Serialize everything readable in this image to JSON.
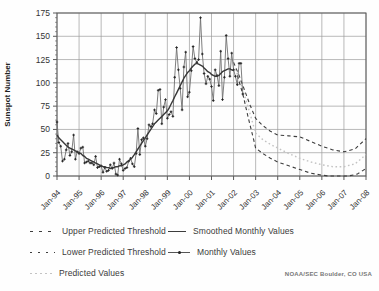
{
  "chart_data": {
    "type": "line",
    "title": "",
    "ylabel": "Sunspot Number",
    "ylim": [
      0,
      175
    ],
    "yticks": [
      0,
      25,
      50,
      75,
      100,
      125,
      150,
      175
    ],
    "y_minor_tick_step": 5,
    "xlim_years": [
      1994,
      2008
    ],
    "xtick_labels": [
      "Jan-94",
      "Jan-95",
      "Jan-96",
      "Jan-97",
      "Jan-98",
      "Jan-99",
      "Jan-00",
      "Jan-01",
      "Jan-02",
      "Jan-03",
      "Jan-04",
      "Jan-05",
      "Jan-06",
      "Jan-07",
      "Jan-08"
    ],
    "grid": true,
    "colors": {
      "grid": "#9b9b9b",
      "axis": "#5a5a5a",
      "monthly_line": "#6f6f6f",
      "monthly_marker": "#222222",
      "smoothed": "#383838",
      "threshold": "#3d3d3d",
      "predicted": "#c3c3c3",
      "tick_text": "#333333"
    },
    "series": [
      {
        "name": "Monthly Values",
        "type": "line+markers",
        "color": "#6f6f6f",
        "x_start": 1994.0,
        "x_step_months": 1,
        "values": [
          58,
          36,
          32,
          16,
          18,
          28,
          35,
          22,
          26,
          44,
          18,
          26,
          24,
          30,
          31,
          14,
          15,
          16,
          14,
          14,
          12,
          21,
          9,
          10,
          11,
          4,
          9,
          5,
          6,
          12,
          8,
          14,
          2,
          1,
          18,
          13,
          6,
          8,
          9,
          16,
          19,
          13,
          10,
          24,
          51,
          23,
          39,
          41,
          32,
          40,
          55,
          53,
          56,
          71,
          67,
          92,
          93,
          56,
          74,
          82,
          62,
          66,
          69,
          64,
          106,
          138,
          114,
          94,
          71,
          117,
          133,
          85,
          90,
          113,
          139,
          126,
          122,
          125,
          170,
          131,
          110,
          99,
          107,
          104,
          96,
          81,
          114,
          108,
          97,
          134,
          82,
          106,
          151,
          126,
          107,
          132,
          114,
          107,
          98,
          121,
          121,
          88
        ]
      },
      {
        "name": "Smoothed Monthly Values",
        "type": "line",
        "color": "#383838",
        "x_start": 1994.0,
        "x_step_months": 1,
        "values": [
          44,
          41,
          39,
          37,
          35,
          33,
          31,
          30,
          29,
          28,
          27,
          26,
          25,
          24,
          22,
          21,
          19,
          18,
          17,
          16,
          15,
          14,
          13,
          12,
          11,
          10,
          10,
          9,
          9,
          8,
          9,
          9,
          10,
          10,
          11,
          11,
          12,
          13,
          15,
          16,
          18,
          20,
          23,
          26,
          29,
          32,
          35,
          38,
          41,
          44,
          47,
          50,
          53,
          56,
          58,
          60,
          62,
          64,
          66,
          68,
          70,
          73,
          77,
          81,
          85,
          89,
          93,
          97,
          101,
          105,
          108,
          111,
          113,
          116,
          118,
          120,
          121,
          120,
          119,
          118,
          116,
          114,
          112,
          111,
          109,
          108,
          107,
          107,
          108,
          110,
          112,
          113,
          114,
          115,
          115,
          114,
          113
        ]
      },
      {
        "name": "Upper Predicted Threshold",
        "type": "dashed",
        "color": "#3d3d3d",
        "points": [
          [
            2002.0,
            122
          ],
          [
            2002.25,
            108
          ],
          [
            2002.5,
            92
          ],
          [
            2002.75,
            76
          ],
          [
            2003.0,
            62
          ],
          [
            2003.33,
            54
          ],
          [
            2003.67,
            48
          ],
          [
            2004.0,
            44
          ],
          [
            2004.5,
            43
          ],
          [
            2005.0,
            42
          ],
          [
            2005.5,
            37
          ],
          [
            2006.0,
            32
          ],
          [
            2006.5,
            28
          ],
          [
            2007.0,
            26
          ],
          [
            2007.5,
            29
          ],
          [
            2008.0,
            40
          ]
        ]
      },
      {
        "name": "Lower Predicted Threshold",
        "type": "dashed",
        "color": "#3d3d3d",
        "points": [
          [
            2002.17,
            108
          ],
          [
            2002.42,
            88
          ],
          [
            2002.67,
            62
          ],
          [
            2002.92,
            38
          ],
          [
            2003.0,
            30
          ],
          [
            2003.33,
            24
          ],
          [
            2003.67,
            19
          ],
          [
            2004.0,
            15
          ],
          [
            2004.5,
            11
          ],
          [
            2005.0,
            7
          ],
          [
            2005.5,
            3
          ],
          [
            2006.0,
            1
          ],
          [
            2006.3,
            0
          ],
          [
            2007.2,
            0
          ],
          [
            2007.6,
            2
          ],
          [
            2008.0,
            8
          ]
        ]
      },
      {
        "name": "Predicted Values",
        "type": "dotted",
        "color": "#c3c3c3",
        "points": [
          [
            2002.08,
            115
          ],
          [
            2002.33,
            99
          ],
          [
            2002.58,
            80
          ],
          [
            2002.83,
            60
          ],
          [
            2003.0,
            46
          ],
          [
            2003.33,
            39
          ],
          [
            2003.67,
            34
          ],
          [
            2004.0,
            30
          ],
          [
            2004.5,
            24
          ],
          [
            2005.0,
            19
          ],
          [
            2005.5,
            15
          ],
          [
            2006.0,
            12
          ],
          [
            2006.5,
            10
          ],
          [
            2007.0,
            10
          ],
          [
            2007.5,
            13
          ],
          [
            2008.0,
            23
          ]
        ]
      }
    ],
    "legend": {
      "upper": {
        "label": "Upper Predicted Threshold"
      },
      "lower": {
        "label": "Lower Predicted Threshold"
      },
      "predicted": {
        "label": "Predicted Values"
      },
      "smoothed": {
        "label": "Smoothed Monthly Values"
      },
      "monthly": {
        "label": "Monthly Values"
      }
    },
    "credit": "NOAA/SEC Boulder, CO USA"
  }
}
